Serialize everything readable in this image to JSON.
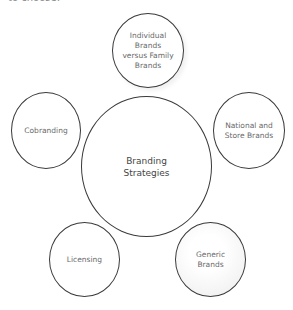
{
  "header": {
    "partial_text": "to choose:"
  },
  "diagram": {
    "title": "Branding Strategies",
    "center": {
      "lines": [
        "Branding",
        "Strategies"
      ]
    },
    "nodes": [
      {
        "id": "individual-vs-family",
        "lines": [
          "Individual",
          "Brands",
          "versus Family",
          "Brands"
        ]
      },
      {
        "id": "national-store",
        "lines": [
          "National and",
          "Store Brands"
        ]
      },
      {
        "id": "generic",
        "lines": [
          "Generic",
          "Brands"
        ]
      },
      {
        "id": "licensing",
        "lines": [
          "Licensing"
        ]
      },
      {
        "id": "cobranding",
        "lines": [
          "Cobranding"
        ]
      }
    ]
  }
}
